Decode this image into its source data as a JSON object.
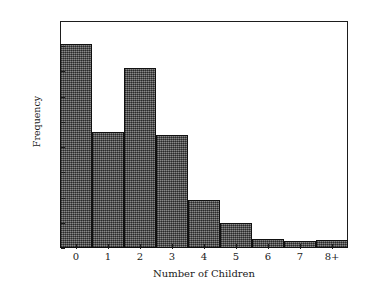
{
  "chart_data": {
    "type": "bar",
    "title": "",
    "xlabel": "Number of Children",
    "ylabel": "Frequency",
    "categories": [
      "0",
      "1",
      "2",
      "3",
      "4",
      "5",
      "6",
      "7",
      "8+"
    ],
    "values": [
      808,
      458,
      712,
      450,
      192,
      100,
      35,
      28,
      32
    ],
    "ylim": [
      0,
      900
    ],
    "yticks": [
      0,
      100,
      200,
      300,
      400,
      500,
      600,
      700,
      800,
      900
    ],
    "ytick_labels": [
      "0",
      "100",
      "200",
      "300",
      "400",
      "500",
      "600",
      "700",
      "800",
      "900"
    ],
    "grid": false,
    "legend": false,
    "bar_fill_color": "#565656",
    "bar_edge_color": "#111111",
    "frame_color": "#1d1d1d",
    "background_color": "#ffffff"
  }
}
